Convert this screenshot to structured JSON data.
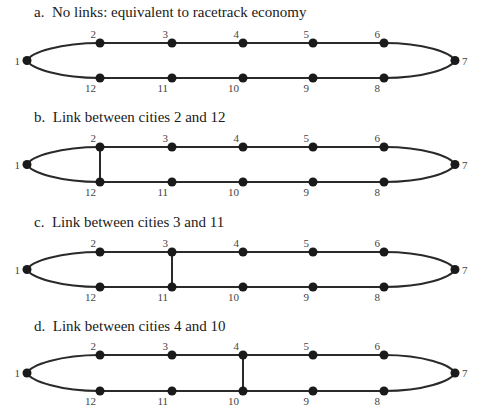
{
  "panels": [
    {
      "id": "a",
      "title": "a.  No links: equivalent to racetrack economy",
      "link": null,
      "title_y": 4,
      "top_y": 43,
      "bottom_y": 78
    },
    {
      "id": "b",
      "title": "b.  Link between cities 2 and 12",
      "link": [
        2,
        12
      ],
      "title_y": 109,
      "top_y": 147,
      "bottom_y": 182
    },
    {
      "id": "c",
      "title": "c.  Link between cities 3 and 11",
      "link": [
        3,
        11
      ],
      "title_y": 214,
      "top_y": 252,
      "bottom_y": 287
    },
    {
      "id": "d",
      "title": "d.  Link between cities 4 and 10",
      "link": [
        4,
        10
      ],
      "title_y": 318,
      "top_y": 355,
      "bottom_y": 391
    }
  ],
  "cities": {
    "top_row": [
      "2",
      "3",
      "4",
      "5",
      "6"
    ],
    "bottom_row": [
      "12",
      "11",
      "10",
      "9",
      "8"
    ],
    "left_end": "1",
    "right_end": "7"
  },
  "layout": {
    "column_x": [
      100,
      172,
      243,
      313,
      384
    ],
    "left_x": 27,
    "right_x": 455,
    "node_color": "#1a1a1a",
    "line_color": "#2a2a2a"
  }
}
